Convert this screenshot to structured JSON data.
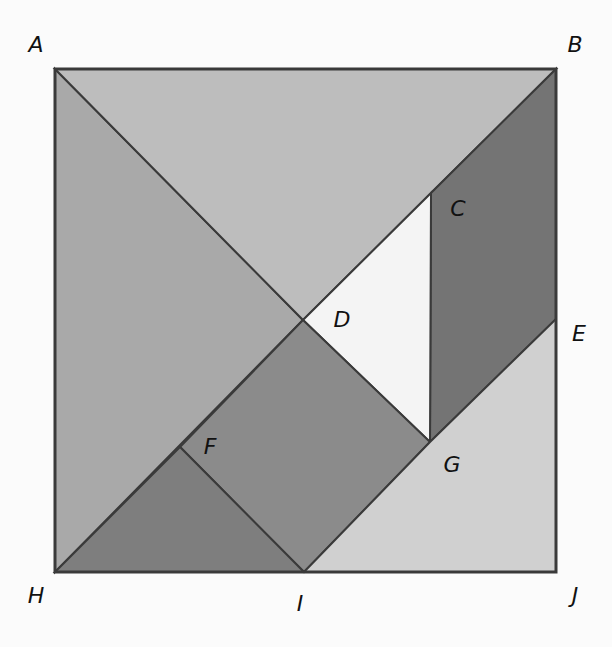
{
  "diagram": {
    "title": "",
    "square": {
      "x1": 55,
      "y1": 69,
      "x2": 556,
      "y2": 572
    },
    "vertices": {
      "A": [
        55,
        69
      ],
      "B": [
        556,
        69
      ],
      "C": [
        431,
        193
      ],
      "D": [
        303,
        320
      ],
      "E": [
        556,
        319
      ],
      "F": [
        180,
        447
      ],
      "G": [
        430,
        442
      ],
      "H": [
        55,
        572
      ],
      "I": [
        304,
        572
      ],
      "J": [
        556,
        572
      ]
    },
    "pieces": [
      {
        "id": "large-triangle-left",
        "vertices": [
          "A",
          "D",
          "H"
        ],
        "color": "#a9a9a9"
      },
      {
        "id": "large-triangle-top",
        "vertices": [
          "A",
          "B",
          "D"
        ],
        "color": "#bdbdbd"
      },
      {
        "id": "parallelogram",
        "vertices": [
          "B",
          "E",
          "G",
          "C"
        ],
        "color": "#747474"
      },
      {
        "id": "medium-triangle-white",
        "vertices": [
          "D",
          "C",
          "G"
        ],
        "color": "#f4f4f4"
      },
      {
        "id": "square-dfig",
        "vertices": [
          "D",
          "G",
          "I",
          "F"
        ],
        "color": "#8b8b8b"
      },
      {
        "id": "small-triangle-fhi",
        "vertices": [
          "F",
          "H",
          "I"
        ],
        "color": "#7e7e7e"
      },
      {
        "id": "trapezoid-egij",
        "vertices": [
          "E",
          "J",
          "I",
          "G"
        ],
        "color": "#d0d0d0"
      }
    ],
    "labels": [
      {
        "text": "A",
        "x": 36,
        "y": 45
      },
      {
        "text": "B",
        "x": 575,
        "y": 45
      },
      {
        "text": "C",
        "x": 458,
        "y": 209
      },
      {
        "text": "D",
        "x": 342,
        "y": 320
      },
      {
        "text": "E",
        "x": 579,
        "y": 334
      },
      {
        "text": "F",
        "x": 210,
        "y": 447
      },
      {
        "text": "G",
        "x": 452,
        "y": 465
      },
      {
        "text": "H",
        "x": 36,
        "y": 596
      },
      {
        "text": "I",
        "x": 300,
        "y": 604
      },
      {
        "text": "J",
        "x": 575,
        "y": 596
      }
    ]
  }
}
